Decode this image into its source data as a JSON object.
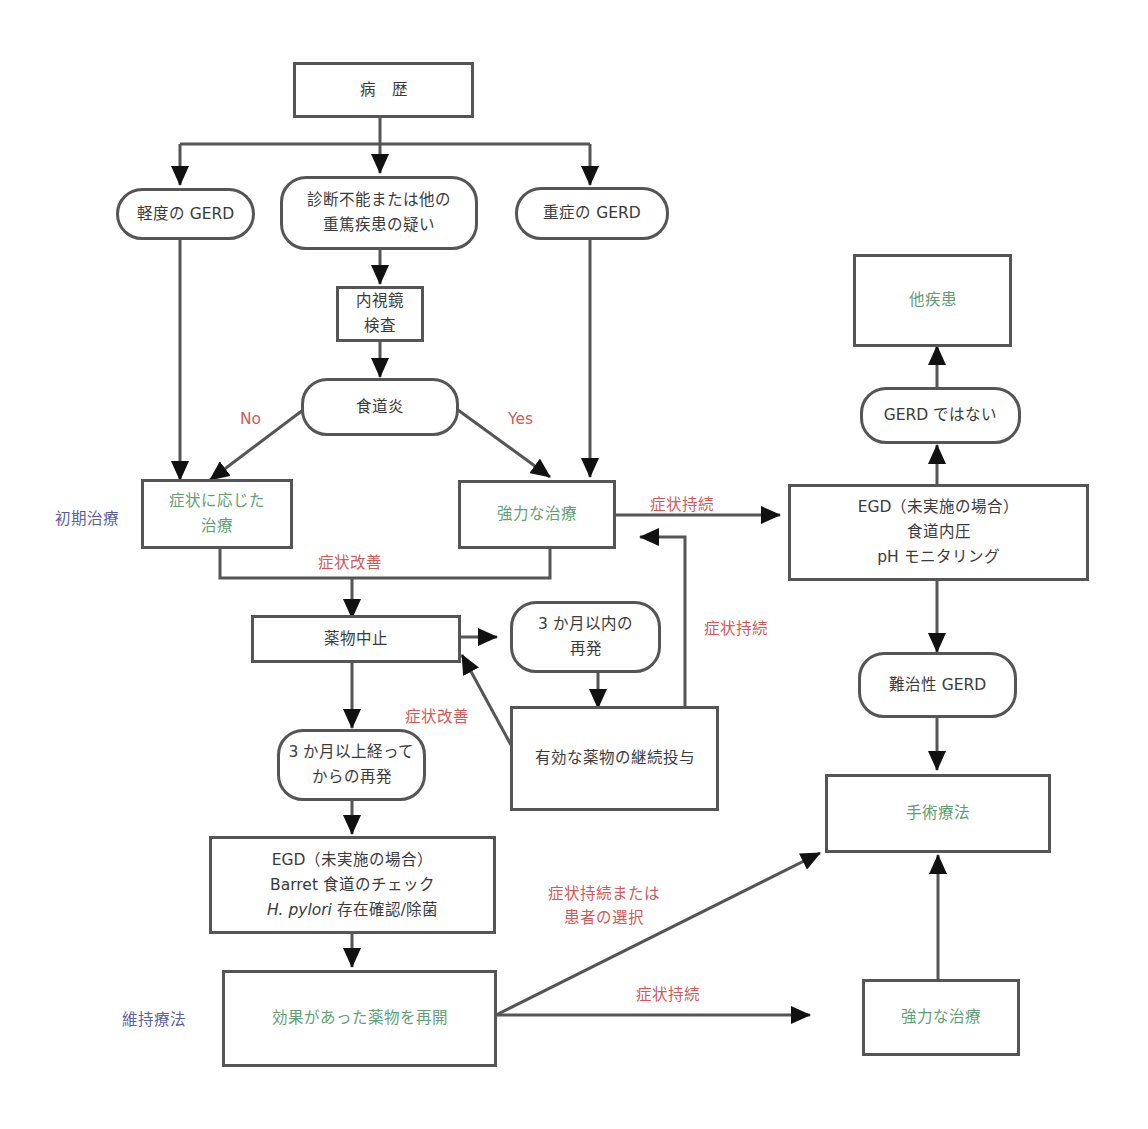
{
  "colors": {
    "line": "#555555",
    "text": "#3a3a3a",
    "green_text": "#5f9e74",
    "red_label": "#cf5a5a",
    "blue_label": "#5a5f9e"
  },
  "nodes": {
    "history": {
      "text": "病　歴"
    },
    "mild_gerd": {
      "text": "軽度の GERD"
    },
    "uncertain": {
      "line1": "診断不能または他の",
      "line2": "重篤疾患の疑い"
    },
    "severe_gerd": {
      "text": "重症の GERD"
    },
    "endoscopy": {
      "line1": "内視鏡",
      "line2": "検査"
    },
    "esophagitis": {
      "text": "食道炎"
    },
    "symptomatic_tx": {
      "line1": "症状に応じた",
      "line2": "治療"
    },
    "intensive_tx": {
      "text": "強力な治療"
    },
    "stop_drug": {
      "text": "薬物中止"
    },
    "relapse_within_3m": {
      "line1": "3 か月以内の",
      "line2": "再発"
    },
    "continue_drug": {
      "text": "有効な薬物の継続投与"
    },
    "relapse_after_3m": {
      "line1": "3 か月以上経って",
      "line2": "からの再発"
    },
    "egd_check": {
      "line1": "EGD（未実施の場合）",
      "line2": "Barret 食道のチェック",
      "line3_italic": "H. pylori",
      "line3_rest": " 存在確認/除菌"
    },
    "resume_drug": {
      "text": "効果があった薬物を再開"
    },
    "other_disease": {
      "text": "他疾患"
    },
    "not_gerd": {
      "text": "GERD ではない"
    },
    "egd_tests": {
      "line1": "EGD（未実施の場合）",
      "line2": "食道内圧",
      "line3": "pH モニタリング"
    },
    "refractory_gerd": {
      "text": "難治性 GERD"
    },
    "surgery": {
      "text": "手術療法"
    },
    "intensive_tx_2": {
      "text": "強力な治療"
    }
  },
  "labels": {
    "no": "No",
    "yes": "Yes",
    "initial_treatment": "初期治療",
    "maintenance": "維持療法",
    "improved_1": "症状改善",
    "improved_2": "症状改善",
    "persist_1": "症状持続",
    "persist_2": "症状持続",
    "persist_3": "症状持続",
    "persist_or_choice_1": "症状持続または",
    "persist_or_choice_2": "患者の選択"
  }
}
